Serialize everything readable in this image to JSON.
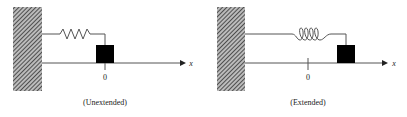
{
  "diagram": {
    "panels": [
      {
        "id": "unextended",
        "caption": "(Unextended)",
        "origin_label": "0",
        "axis_label": "x",
        "spring_style": "zigzag",
        "state": "block at origin"
      },
      {
        "id": "extended",
        "caption": "(Extended)",
        "origin_label": "0",
        "axis_label": "x",
        "spring_style": "coil",
        "state": "block displaced to positive x"
      }
    ],
    "colors": {
      "line": "#555555",
      "block": "#000000",
      "wall_hatch": "#333333",
      "background": "#ffffff"
    }
  }
}
